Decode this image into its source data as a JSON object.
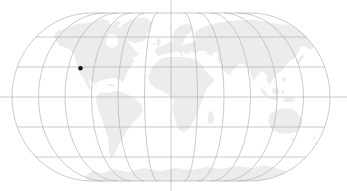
{
  "map": {
    "description": "world-map-graticule-with-location-dot",
    "colors": {
      "background": "#ffffff",
      "land": "#ececec",
      "graticule": "#b3b3b3",
      "outline": "#b3b3b3",
      "marker": "#111111",
      "water_cutout": "#ffffff"
    },
    "projection": {
      "cx": 171,
      "cy": 97,
      "half_equator_width": 159,
      "half_height": 84,
      "pole_half_width": 79.5,
      "cap_rx": 79.5,
      "meridians_per_side": 5,
      "parallel_step_px": 30,
      "parallels_per_side": 2,
      "stroke_width": 0.7,
      "equator_full_width": true,
      "central_meridian_full_height": true,
      "canvas_width": 347,
      "canvas_height": 191
    },
    "marker": {
      "name": "location-dot",
      "x": 80.5,
      "y": 68.2,
      "radius": 2.2
    },
    "landmasses": [
      {
        "name": "greenland",
        "d": "M118,33 L121,26 L128,21 L137,18 L146,18 L152,22 L151,28 L146,32 L148,37 L142,42 L134,43 L126,40 L120,38 Z"
      },
      {
        "name": "arctic-islands",
        "d": "M94,21 L103,19 L110,21 L106,24 L97,24 Z M113,22 L119,21 L121,24 L115,26 Z"
      },
      {
        "name": "north-america",
        "d": "M57,42 L54,37 L57,31 L64,29 L69,27 L76,24 L85,23 L95,22 L104,22 L112,24 L119,27 L123,31 L121,35 L125,38 L129,43 L134,49 L139,54 L136,57 L132,57 L134,61 L131,66 L128,71 L126,76 L124,80 L123,83 L119,79 L113,78 L106,79 L99,81 L95,84 L98,88 L103,92 L107,95 L110,97 L107,96 L102,91 L97,87 L93,82 L89,80 L90,85 L92,90 L89,89 L86,84 L84,79 L80,74 L78,68 L76,61 L74,54 L70,50 L64,47 L59,45 Z"
      },
      {
        "name": "cuba",
        "d": "M106,84 L112,84 L116,86 L110,86 Z"
      },
      {
        "name": "south-america",
        "d": "M109,93 L115,91 L122,92 L129,95 L136,99 L141,104 L143,110 L140,116 L134,122 L129,128 L125,134 L121,141 L117,149 L114,155 L111,158 L109,153 L109,146 L108,138 L105,129 L102,119 L98,109 L96,101 L97,95 L102,92 Z"
      },
      {
        "name": "iceland",
        "d": "M145,31 L149,29 L151,32 L147,33 Z"
      },
      {
        "name": "british-isles",
        "d": "M157,46 L156,41 L159,38 L161,42 L160,46 Z M153,43 L155,42 L155,45 L153,45 Z"
      },
      {
        "name": "eurasia",
        "d": "M158,56 L155,52 L156,48 L161,46 L166,44 L170,42 L173,43 L172,37 L175,30 L181,25 L188,24 L193,27 L191,32 L186,36 L184,41 L181,45 L186,44 L191,43 L196,40 L194,34 L199,29 L207,26 L217,23 L229,21 L242,20 L255,20 L267,22 L278,24 L289,25 L299,26 L308,28 L318,31 L315,35 L309,37 L310,42 L314,47 L310,50 L305,46 L300,48 L298,53 L295,58 L290,61 L285,66 L282,71 L277,74 L273,79 L270,85 L267,81 L267,75 L262,71 L258,74 L254,81 L251,74 L248,67 L243,64 L238,65 L233,70 L229,75 L223,70 L220,63 L215,58 L209,55 L203,53 L197,53 L191,52 L186,54 L183,51 L182,57 L179,52 L174,52 L168,53 L163,55 Z"
      },
      {
        "name": "japan",
        "d": "M296,63 L299,58 L303,54 L304,57 L300,62 L298,65 Z"
      },
      {
        "name": "africa",
        "d": "M160,59 L167,57 L175,57 L183,57 L191,58 L198,61 L202,65 L206,71 L211,77 L215,80 L211,84 L206,90 L203,98 L200,106 L197,114 L193,122 L189,129 L184,132 L179,130 L176,124 L174,116 L172,107 L174,100 L169,95 L162,91 L155,88 L150,83 L148,77 L151,70 L155,64 Z"
      },
      {
        "name": "madagascar",
        "d": "M209,111 L213,112 L214,118 L212,124 L208,123 L208,116 Z"
      },
      {
        "name": "southeast-asia-islands",
        "d": "M260,87 L265,91 L268,95 L265,96 L261,91 Z M269,97 L276,98 L280,99 L276,100 L270,99 Z M272,89 L277,88 L280,92 L277,95 L273,93 Z M282,90 L285,92 L283,95 L281,92 Z M283,77 L286,79 L284,82 L282,79 Z"
      },
      {
        "name": "new-guinea",
        "d": "M283,100 L288,97 L294,98 L296,101 L290,102 L284,102 Z"
      },
      {
        "name": "australia",
        "d": "M268,121 L270,114 L276,110 L284,108 L292,109 L299,114 L302,120 L301,127 L296,132 L288,134 L279,133 L271,129 Z"
      },
      {
        "name": "tasmania",
        "d": "M291,138 L294,138 L293,141 L291,140 Z"
      },
      {
        "name": "new-zealand",
        "d": "M313,135 L315,138 L313,140 Z M315,141 L318,144 L316,146 Z"
      },
      {
        "name": "antarctica",
        "d": "M84,176 L92,171 L102,173 L114,169 L128,172 L144,168 L160,171 L176,168 L192,170 L207,167 L222,169 L237,166 L252,168 L265,165 L276,168 L285,171 L290,175 L288,182 L100,182 L88,180 Z"
      }
    ],
    "water_cutouts": [
      {
        "name": "hudson-bay",
        "cx": 112,
        "cy": 41,
        "rx": 6,
        "ry": 7
      },
      {
        "name": "black-sea",
        "cx": 202,
        "cy": 53,
        "rx": 5,
        "ry": 2
      },
      {
        "name": "caspian-sea",
        "cx": 215,
        "cy": 57,
        "rx": 3,
        "ry": 5
      }
    ]
  }
}
